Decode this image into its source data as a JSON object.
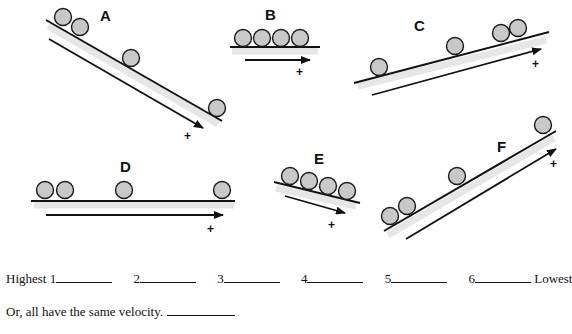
{
  "diagrams": [
    {
      "label": "A",
      "direction_sign": "+",
      "description": "downhill incline, balls spreading apart"
    },
    {
      "label": "B",
      "direction_sign": "+",
      "description": "horizontal, balls evenly touching"
    },
    {
      "label": "C",
      "direction_sign": "+",
      "description": "uphill incline, balls bunching together"
    },
    {
      "label": "D",
      "direction_sign": "+",
      "description": "horizontal, balls spreading apart"
    },
    {
      "label": "E",
      "direction_sign": "+",
      "description": "short downhill, balls touching"
    },
    {
      "label": "F",
      "direction_sign": "+",
      "description": "uphill incline, balls spreading apart"
    }
  ],
  "ranking": {
    "highest_label": "Highest",
    "lowest_label": "Lowest",
    "slots": [
      "1",
      "2",
      "3",
      "4",
      "5",
      "6"
    ]
  },
  "same_option": "Or, all have the same velocity."
}
